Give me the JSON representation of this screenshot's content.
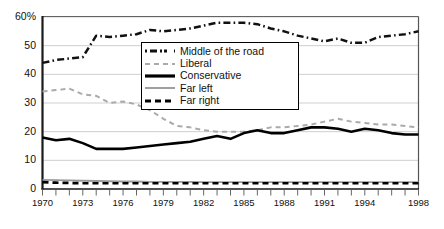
{
  "chart_data": {
    "type": "line",
    "title": "",
    "subtitle": "",
    "xlabel": "",
    "ylabel": "",
    "xlim": [
      1970,
      1998
    ],
    "ylim": [
      0,
      60
    ],
    "grid": "horizontal",
    "legend_position": "upper-center",
    "x": [
      1970,
      1971,
      1972,
      1973,
      1974,
      1975,
      1976,
      1977,
      1978,
      1979,
      1980,
      1981,
      1982,
      1983,
      1984,
      1985,
      1986,
      1987,
      1988,
      1989,
      1990,
      1991,
      1992,
      1993,
      1994,
      1995,
      1996,
      1997,
      1998
    ],
    "xtick_labels": [
      "1970",
      "1973",
      "1976",
      "1979",
      "1982",
      "1985",
      "1988",
      "1991",
      "1994",
      "1998"
    ],
    "xtick_values": [
      1970,
      1973,
      1976,
      1979,
      1982,
      1985,
      1988,
      1991,
      1994,
      1998
    ],
    "ytick_labels": [
      "0",
      "10",
      "20",
      "30",
      "40",
      "50",
      "60%"
    ],
    "ytick_values": [
      0,
      10,
      20,
      30,
      40,
      50,
      60
    ],
    "series": [
      {
        "name": "Middle of the road",
        "color": "#111111",
        "style": "dash-dot",
        "values": [
          44,
          45,
          45.5,
          46,
          53.5,
          53,
          53.5,
          54,
          55.5,
          55,
          55.5,
          56,
          57,
          58,
          58,
          58,
          57.5,
          56,
          55,
          53.5,
          52.5,
          51.5,
          52.5,
          51,
          51,
          53,
          53.5,
          54,
          55
        ]
      },
      {
        "name": "Liberal",
        "color": "#aaaaaa",
        "style": "dashed",
        "values": [
          34,
          34.5,
          35,
          33,
          32.5,
          30,
          30.5,
          29.5,
          27.5,
          24.5,
          22,
          21.5,
          20.5,
          20,
          20,
          20,
          20.5,
          21.5,
          21.5,
          22,
          22.5,
          23.5,
          24.5,
          23.5,
          23,
          22.5,
          22.5,
          22,
          21.5
        ]
      },
      {
        "name": "Conservative",
        "color": "#000000",
        "style": "solid",
        "values": [
          18,
          17,
          17.5,
          16,
          14,
          14,
          14,
          14.5,
          15,
          15.5,
          16,
          16.5,
          17.5,
          18.5,
          17.5,
          19.5,
          20.5,
          19.5,
          19.5,
          20.5,
          21.5,
          21.5,
          21,
          20,
          21,
          20.5,
          19.5,
          19,
          19
        ]
      },
      {
        "name": "Far left",
        "color": "#9a9a9a",
        "style": "solid",
        "values": [
          3.2,
          3.1,
          3,
          2.9,
          2.8,
          2.7,
          2.6,
          2.6,
          2.5,
          2.5,
          2.5,
          2.5,
          2.4,
          2.4,
          2.4,
          2.4,
          2.4,
          2.4,
          2.4,
          2.4,
          2.4,
          2.4,
          2.4,
          2.4,
          2.4,
          2.4,
          2.4,
          2.4,
          2.4
        ]
      },
      {
        "name": "Far right",
        "color": "#000000",
        "style": "dashed-thick",
        "values": [
          2.4,
          2.2,
          2.1,
          2,
          2,
          2,
          2,
          2,
          2,
          2,
          2,
          2,
          2,
          2,
          2,
          2,
          2,
          2,
          2,
          2,
          2,
          2,
          2,
          2,
          2,
          2,
          2,
          2,
          2
        ]
      }
    ]
  },
  "legend": {
    "entries": [
      {
        "label": "Middle of the road"
      },
      {
        "label": "Liberal"
      },
      {
        "label": "Conservative"
      },
      {
        "label": "Far left"
      },
      {
        "label": "Far right"
      }
    ]
  }
}
